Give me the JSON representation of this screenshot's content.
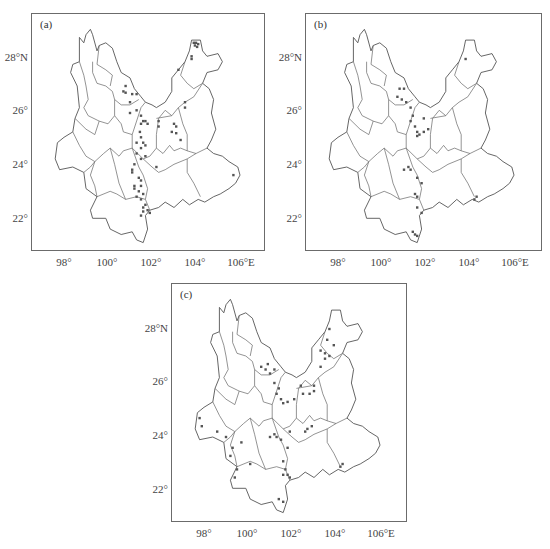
{
  "figure": {
    "panels": [
      {
        "id": "a",
        "label": "(a)"
      },
      {
        "id": "b",
        "label": "(b)"
      },
      {
        "id": "c",
        "label": "(c)"
      }
    ],
    "x_ticks": [
      "98°",
      "100°",
      "102°",
      "104°",
      "106°E"
    ],
    "y_ticks": [
      "28°N",
      "26°",
      "24°",
      "22°"
    ]
  },
  "chart_data": [
    {
      "type": "scatter",
      "title": "(a)",
      "xlabel": "Longitude",
      "ylabel": "Latitude",
      "xlim": [
        96.6,
        107.2
      ],
      "ylim": [
        20.8,
        29.6
      ],
      "x_ticks": [
        98,
        100,
        102,
        104,
        106
      ],
      "y_ticks": [
        22,
        24,
        26,
        28
      ],
      "background": "Yunnan province prefecture boundary map",
      "points": [
        [
          103.9,
          28.6
        ],
        [
          104.0,
          28.6
        ],
        [
          104.1,
          28.55
        ],
        [
          103.95,
          28.5
        ],
        [
          104.05,
          28.45
        ],
        [
          103.8,
          28.1
        ],
        [
          103.8,
          28.0
        ],
        [
          103.2,
          27.6
        ],
        [
          100.8,
          27.0
        ],
        [
          100.7,
          26.8
        ],
        [
          100.8,
          26.75
        ],
        [
          101.1,
          26.7
        ],
        [
          101.0,
          26.4
        ],
        [
          101.3,
          26.7
        ],
        [
          101.0,
          26.0
        ],
        [
          101.3,
          26.1
        ],
        [
          101.5,
          25.9
        ],
        [
          101.6,
          25.7
        ],
        [
          101.7,
          25.7
        ],
        [
          101.5,
          25.6
        ],
        [
          101.8,
          25.6
        ],
        [
          101.45,
          25.3
        ],
        [
          101.5,
          25.1
        ],
        [
          101.3,
          24.9
        ],
        [
          101.6,
          24.9
        ],
        [
          101.7,
          24.8
        ],
        [
          101.5,
          24.7
        ],
        [
          101.3,
          24.5
        ],
        [
          101.5,
          24.3
        ],
        [
          101.7,
          24.4
        ],
        [
          101.2,
          24.1
        ],
        [
          102.3,
          25.7
        ],
        [
          102.3,
          25.5
        ],
        [
          103.0,
          25.6
        ],
        [
          103.1,
          25.5
        ],
        [
          102.9,
          25.3
        ],
        [
          103.1,
          25.25
        ],
        [
          103.3,
          25.0
        ],
        [
          103.5,
          26.4
        ],
        [
          103.5,
          26.2
        ],
        [
          101.1,
          23.9
        ],
        [
          101.1,
          23.8
        ],
        [
          101.4,
          23.6
        ],
        [
          101.5,
          23.5
        ],
        [
          101.2,
          23.3
        ],
        [
          101.5,
          23.3
        ],
        [
          101.2,
          23.2
        ],
        [
          101.4,
          23.1
        ],
        [
          101.6,
          23.0
        ],
        [
          101.3,
          22.9
        ],
        [
          101.5,
          22.8
        ],
        [
          101.7,
          22.6
        ],
        [
          101.6,
          22.5
        ],
        [
          101.8,
          22.4
        ],
        [
          101.9,
          22.3
        ],
        [
          101.5,
          22.2
        ],
        [
          101.6,
          22.35
        ],
        [
          105.7,
          23.7
        ],
        [
          102.2,
          24.0
        ]
      ]
    },
    {
      "type": "scatter",
      "title": "(b)",
      "xlabel": "Longitude",
      "ylabel": "Latitude",
      "xlim": [
        96.6,
        107.2
      ],
      "ylim": [
        20.8,
        29.6
      ],
      "x_ticks": [
        98,
        100,
        102,
        104,
        106
      ],
      "y_ticks": [
        22,
        24,
        26,
        28
      ],
      "background": "Yunnan province prefecture boundary map",
      "points": [
        [
          103.8,
          28.0
        ],
        [
          100.8,
          26.9
        ],
        [
          101.0,
          26.9
        ],
        [
          100.7,
          26.6
        ],
        [
          100.9,
          26.5
        ],
        [
          101.1,
          26.4
        ],
        [
          101.3,
          26.2
        ],
        [
          101.4,
          25.9
        ],
        [
          101.3,
          25.7
        ],
        [
          101.5,
          25.5
        ],
        [
          101.6,
          25.3
        ],
        [
          101.7,
          25.2
        ],
        [
          101.9,
          25.3
        ],
        [
          102.1,
          25.4
        ],
        [
          101.9,
          25.8
        ],
        [
          101.6,
          25.15
        ],
        [
          101.0,
          23.9
        ],
        [
          101.2,
          24.0
        ],
        [
          101.3,
          23.9
        ],
        [
          101.6,
          23.6
        ],
        [
          101.8,
          23.4
        ],
        [
          101.5,
          23.0
        ],
        [
          101.6,
          22.9
        ],
        [
          101.6,
          22.5
        ],
        [
          101.8,
          22.3
        ],
        [
          101.4,
          21.6
        ],
        [
          101.5,
          21.5
        ],
        [
          101.6,
          21.45
        ],
        [
          104.3,
          22.9
        ],
        [
          104.2,
          22.8
        ]
      ]
    },
    {
      "type": "scatter",
      "title": "(c)",
      "xlabel": "Longitude",
      "ylabel": "Latitude",
      "xlim": [
        96.6,
        107.2
      ],
      "ylim": [
        20.8,
        29.6
      ],
      "x_ticks": [
        98,
        100,
        102,
        104,
        106
      ],
      "y_ticks": [
        22,
        24,
        26,
        28
      ],
      "background": "Yunnan province prefecture boundary map",
      "points": [
        [
          103.7,
          28.0
        ],
        [
          103.6,
          27.6
        ],
        [
          103.9,
          27.4
        ],
        [
          103.5,
          27.1
        ],
        [
          103.7,
          27.0
        ],
        [
          103.3,
          27.2
        ],
        [
          103.5,
          26.9
        ],
        [
          103.3,
          26.6
        ],
        [
          100.6,
          26.6
        ],
        [
          100.8,
          26.5
        ],
        [
          100.9,
          26.7
        ],
        [
          101.0,
          26.35
        ],
        [
          101.2,
          26.5
        ],
        [
          101.2,
          26.0
        ],
        [
          101.3,
          25.6
        ],
        [
          101.5,
          25.4
        ],
        [
          101.6,
          25.25
        ],
        [
          101.8,
          25.3
        ],
        [
          102.1,
          25.4
        ],
        [
          101.4,
          25.8
        ],
        [
          102.4,
          25.9
        ],
        [
          102.5,
          25.6
        ],
        [
          102.8,
          25.6
        ],
        [
          103.0,
          25.9
        ],
        [
          103.0,
          25.7
        ],
        [
          97.8,
          24.7
        ],
        [
          97.9,
          24.4
        ],
        [
          98.6,
          24.2
        ],
        [
          99.0,
          24.0
        ],
        [
          99.3,
          23.6
        ],
        [
          99.7,
          23.8
        ],
        [
          99.2,
          23.3
        ],
        [
          100.1,
          23.0
        ],
        [
          99.5,
          22.8
        ],
        [
          99.4,
          22.5
        ],
        [
          101.0,
          24.0
        ],
        [
          101.2,
          24.1
        ],
        [
          101.3,
          24.0
        ],
        [
          101.5,
          23.9
        ],
        [
          101.8,
          23.6
        ],
        [
          101.9,
          24.2
        ],
        [
          102.6,
          24.2
        ],
        [
          102.7,
          24.3
        ],
        [
          102.9,
          24.4
        ],
        [
          101.6,
          23.1
        ],
        [
          101.7,
          22.8
        ],
        [
          101.6,
          22.6
        ],
        [
          101.8,
          22.6
        ],
        [
          101.9,
          22.5
        ],
        [
          101.4,
          21.7
        ],
        [
          101.6,
          21.6
        ],
        [
          104.3,
          23.0
        ],
        [
          104.2,
          22.9
        ]
      ]
    }
  ]
}
